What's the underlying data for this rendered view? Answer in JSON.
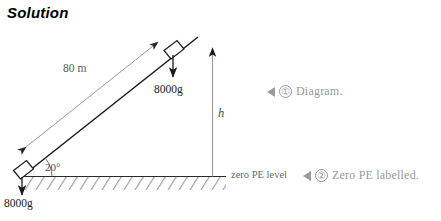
{
  "title": "Solution",
  "diagram": {
    "incline_length_label": "80 m",
    "angle_label": "20°",
    "height_label": "h",
    "zero_pe_label": "zero PE level",
    "weight_label_upper": "8000g",
    "weight_label_lower": "8000g",
    "colors": {
      "ink": "#1a1a1a",
      "dimension_gray": "#8c8c8c",
      "text_gray": "#5a5a5a",
      "annotation_gray": "#9a9a9a",
      "background": "#ffffff"
    }
  },
  "annotations": [
    {
      "marker": "◀",
      "number": "①",
      "text": "Diagram."
    },
    {
      "marker": "◀",
      "number": "②",
      "text": "Zero PE labelled."
    }
  ]
}
